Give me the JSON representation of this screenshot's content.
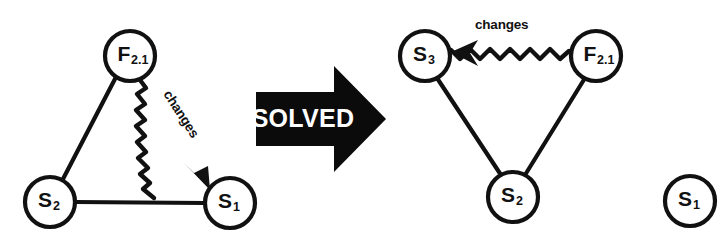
{
  "figure": {
    "background_color": "#ffffff",
    "ink_color": "#111111",
    "transition": {
      "label": "SOLVED",
      "shape": "block-arrow-right",
      "fill_color": "#0b0b0b",
      "text_color": "#ffffff"
    },
    "left_graph": {
      "name": "before",
      "nodes": [
        {
          "id": "F2.1",
          "base": "F",
          "sub": "2.1",
          "cx": 130,
          "cy": 56,
          "r": 25
        },
        {
          "id": "S2",
          "base": "S",
          "sub": "2",
          "cx": 50,
          "cy": 202,
          "r": 25
        },
        {
          "id": "S1",
          "base": "S",
          "sub": "1",
          "cx": 230,
          "cy": 203,
          "r": 25
        }
      ],
      "edges": [
        {
          "from": "F2.1",
          "to": "S2",
          "style": "straight",
          "arrow": false
        },
        {
          "from": "S2",
          "to": "S1",
          "style": "straight",
          "arrow": false
        },
        {
          "from": "F2.1",
          "to": "S1",
          "style": "wavy",
          "arrow": true,
          "label": "changes"
        }
      ]
    },
    "right_graph": {
      "name": "after",
      "nodes": [
        {
          "id": "S3",
          "base": "S",
          "sub": "3",
          "cx": 425,
          "cy": 56,
          "r": 25
        },
        {
          "id": "F2.1",
          "base": "F",
          "sub": "2.1",
          "cx": 596,
          "cy": 56,
          "r": 25
        },
        {
          "id": "S2",
          "base": "S",
          "sub": "2",
          "cx": 513,
          "cy": 197,
          "r": 25
        },
        {
          "id": "S1",
          "base": "S",
          "sub": "1",
          "cx": 690,
          "cy": 201,
          "r": 25,
          "isolated": true
        }
      ],
      "edges": [
        {
          "from": "F2.1",
          "to": "S3",
          "style": "wavy",
          "arrow": true,
          "label": "changes"
        },
        {
          "from": "S3",
          "to": "S2",
          "style": "straight",
          "arrow": false
        },
        {
          "from": "F2.1",
          "to": "S2",
          "style": "straight",
          "arrow": false
        }
      ]
    }
  }
}
